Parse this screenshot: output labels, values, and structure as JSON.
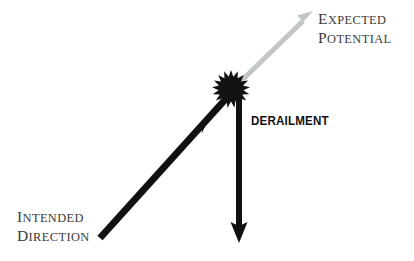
{
  "figure": {
    "background_color": "#ffffff",
    "labels": {
      "intended_direction": {
        "line1_first": "I",
        "line1_rest": "NTENDED",
        "line2_first": "D",
        "line2_rest": "IRECTION"
      },
      "expected_potential": {
        "line1_first": "E",
        "line1_rest": "XPECTED",
        "line2_first": "P",
        "line2_rest": "OTENTIAL"
      },
      "derailment": "DERAILMENT"
    },
    "colors": {
      "black_arrow": "#111111",
      "gray_arrow": "#c3c6c7",
      "serif_text": "#3b3b3b",
      "sans_text": "#111111",
      "burst": "#121212"
    },
    "elements": {
      "intended_direction_arrow": {
        "from_x": 100,
        "from_y": 238,
        "to_x": 231,
        "to_y": 93,
        "thickness": 7,
        "mid_arrowhead_x": 203,
        "mid_arrowhead_y": 124
      },
      "derailment_arrow": {
        "from_x": 239,
        "from_y": 95,
        "to_x": 239,
        "to_y": 241,
        "thickness": 6
      },
      "expected_potential_arrow": {
        "from_x": 240,
        "from_y": 82,
        "to_x": 313,
        "to_y": 11,
        "thickness": 5
      },
      "burst": {
        "center_x": 231,
        "center_y": 89,
        "outer_radius": 19,
        "inner_radius": 12.5,
        "spikes": 17
      }
    }
  }
}
